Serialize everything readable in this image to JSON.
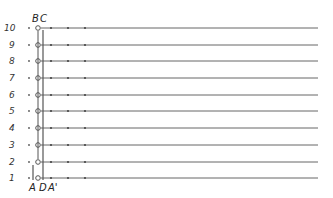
{
  "diagram": {
    "type": "ladder-schematic",
    "rows": [
      {
        "label": "10",
        "y": 28
      },
      {
        "label": "9",
        "y": 45
      },
      {
        "label": "8",
        "y": 61
      },
      {
        "label": "7",
        "y": 78
      },
      {
        "label": "6",
        "y": 95
      },
      {
        "label": "5",
        "y": 111
      },
      {
        "label": "4",
        "y": 128
      },
      {
        "label": "3",
        "y": 145
      },
      {
        "label": "2",
        "y": 162
      },
      {
        "label": "1",
        "y": 178
      }
    ],
    "top_labels": {
      "b": "B",
      "c": "C"
    },
    "bottom_labels": {
      "a": "A",
      "d": "D",
      "a_prime": "A'"
    },
    "line_color": "#555555",
    "text_color": "#222222"
  }
}
